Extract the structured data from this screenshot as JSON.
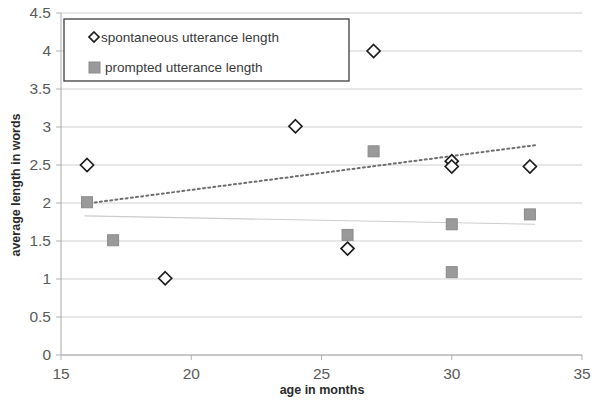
{
  "chart_data": {
    "type": "scatter",
    "title": "",
    "xlabel": "age in months",
    "ylabel": "average length in words",
    "xlim": [
      15,
      35
    ],
    "ylim": [
      0,
      4.5
    ],
    "xticks": [
      "15",
      "20",
      "25",
      "30",
      "35"
    ],
    "xtick_values": [
      15,
      20,
      25,
      30,
      35
    ],
    "yticks": [
      "0",
      "0.5",
      "1",
      "1.5",
      "2",
      "2.5",
      "3",
      "3.5",
      "4",
      "4.5"
    ],
    "ytick_values": [
      0,
      0.5,
      1,
      1.5,
      2,
      2.5,
      3,
      3.5,
      4,
      4.5
    ],
    "grid": true,
    "grid_axis": "y",
    "legend_position": "top-left-inside",
    "series": [
      {
        "name": "spontaneous utterance length",
        "marker": "diamond-open",
        "color": "#1c1c1c",
        "points": [
          {
            "x": 16,
            "y": 2.5
          },
          {
            "x": 19,
            "y": 1.01
          },
          {
            "x": 24,
            "y": 3.01
          },
          {
            "x": 26,
            "y": 1.4
          },
          {
            "x": 27,
            "y": 4.0
          },
          {
            "x": 30,
            "y": 2.55
          },
          {
            "x": 30,
            "y": 2.48
          },
          {
            "x": 33,
            "y": 2.48
          }
        ]
      },
      {
        "name": "prompted utterance length",
        "marker": "square-filled",
        "color": "#9a9a9a",
        "points": [
          {
            "x": 16,
            "y": 2.01
          },
          {
            "x": 17,
            "y": 1.51
          },
          {
            "x": 26,
            "y": 1.58
          },
          {
            "x": 27,
            "y": 2.68
          },
          {
            "x": 30,
            "y": 1.72
          },
          {
            "x": 30,
            "y": 1.09
          },
          {
            "x": 33,
            "y": 1.85
          }
        ]
      }
    ],
    "trendlines": [
      {
        "name": "spontaneous trendline",
        "style": "dotted",
        "color": "#6e6e6e",
        "x_start": 15.9,
        "y_start": 1.99,
        "x_end": 33.2,
        "y_end": 2.76
      },
      {
        "name": "prompted trendline",
        "style": "solid-faint",
        "color": "#cccccc",
        "x_start": 15.9,
        "y_start": 1.83,
        "x_end": 33.2,
        "y_end": 1.72
      }
    ]
  },
  "legend": {
    "entries": [
      {
        "label": "spontaneous utterance length",
        "marker": "diamond-open"
      },
      {
        "label": "prompted utterance length",
        "marker": "square-filled"
      }
    ]
  },
  "axes": {
    "x_title": "age in months",
    "y_title": "average length in words"
  }
}
